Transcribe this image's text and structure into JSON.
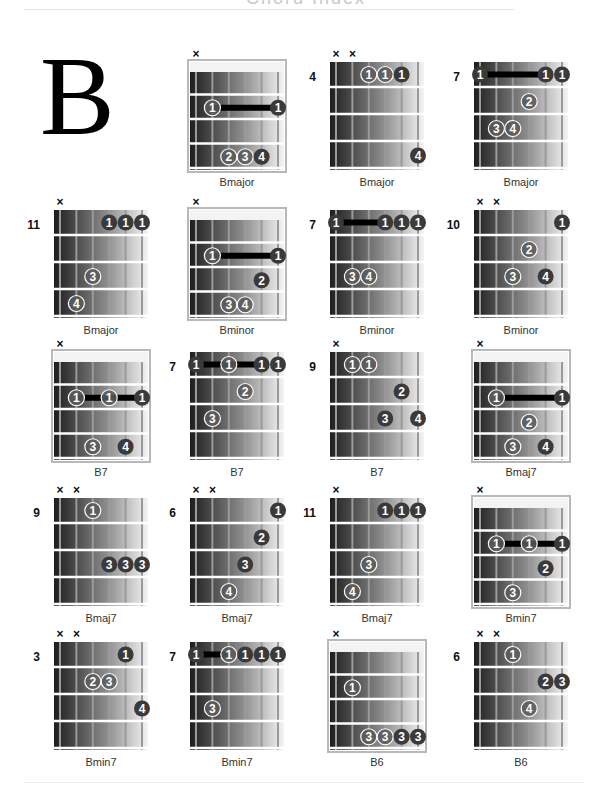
{
  "page": {
    "header_title": "Chord Index",
    "key_letter": "B"
  },
  "colors": {
    "finger_dark": "#3a3a3a",
    "finger_ring": "#ffffff",
    "barre": "#000000",
    "fret_line": "#ffffff",
    "string_line": "#9a9a9a",
    "nut": "#f3f3f3",
    "frame": "#b8b8b8"
  },
  "chords": [
    {
      "name": "Bmajor",
      "start_fret": null,
      "muted": [
        1
      ],
      "barres": [
        {
          "fret": 2,
          "from": 2,
          "to": 6
        }
      ],
      "fingers": [
        {
          "string": 2,
          "fret": 2,
          "finger": "1",
          "style": "light"
        },
        {
          "string": 6,
          "fret": 2,
          "finger": "1",
          "style": "dark"
        },
        {
          "string": 3,
          "fret": 4,
          "finger": "2",
          "style": "light"
        },
        {
          "string": 4,
          "fret": 4,
          "finger": "3",
          "style": "light"
        },
        {
          "string": 5,
          "fret": 4,
          "finger": "4",
          "style": "dark"
        }
      ]
    },
    {
      "name": "Bmajor",
      "start_fret": "4",
      "muted": [
        1,
        2
      ],
      "barres": [],
      "fingers": [
        {
          "string": 3,
          "fret": 1,
          "finger": "1",
          "style": "light"
        },
        {
          "string": 4,
          "fret": 1,
          "finger": "1",
          "style": "light"
        },
        {
          "string": 5,
          "fret": 1,
          "finger": "1",
          "style": "dark"
        },
        {
          "string": 6,
          "fret": 4,
          "finger": "4",
          "style": "dark"
        }
      ]
    },
    {
      "name": "Bmajor",
      "start_fret": "7",
      "muted": [],
      "barres": [
        {
          "fret": 1,
          "from": 1,
          "to": 5
        }
      ],
      "fingers": [
        {
          "string": 1,
          "fret": 1,
          "finger": "1",
          "style": "dark"
        },
        {
          "string": 5,
          "fret": 1,
          "finger": "1",
          "style": "dark"
        },
        {
          "string": 6,
          "fret": 1,
          "finger": "1",
          "style": "dark"
        },
        {
          "string": 4,
          "fret": 2,
          "finger": "2",
          "style": "light"
        },
        {
          "string": 2,
          "fret": 3,
          "finger": "3",
          "style": "light"
        },
        {
          "string": 3,
          "fret": 3,
          "finger": "4",
          "style": "light"
        }
      ]
    },
    {
      "name": "Bmajor",
      "start_fret": "11",
      "muted": [
        1
      ],
      "barres": [],
      "fingers": [
        {
          "string": 4,
          "fret": 1,
          "finger": "1",
          "style": "dark"
        },
        {
          "string": 5,
          "fret": 1,
          "finger": "1",
          "style": "dark"
        },
        {
          "string": 6,
          "fret": 1,
          "finger": "1",
          "style": "dark"
        },
        {
          "string": 3,
          "fret": 3,
          "finger": "3",
          "style": "light"
        },
        {
          "string": 2,
          "fret": 4,
          "finger": "4",
          "style": "light"
        }
      ]
    },
    {
      "name": "Bminor",
      "start_fret": null,
      "muted": [
        1
      ],
      "barres": [
        {
          "fret": 2,
          "from": 2,
          "to": 6
        }
      ],
      "fingers": [
        {
          "string": 2,
          "fret": 2,
          "finger": "1",
          "style": "light"
        },
        {
          "string": 6,
          "fret": 2,
          "finger": "1",
          "style": "dark"
        },
        {
          "string": 5,
          "fret": 3,
          "finger": "2",
          "style": "dark"
        },
        {
          "string": 3,
          "fret": 4,
          "finger": "3",
          "style": "light"
        },
        {
          "string": 4,
          "fret": 4,
          "finger": "4",
          "style": "light"
        }
      ]
    },
    {
      "name": "Bminor",
      "start_fret": "7",
      "muted": [],
      "barres": [
        {
          "fret": 1,
          "from": 1,
          "to": 4
        }
      ],
      "fingers": [
        {
          "string": 1,
          "fret": 1,
          "finger": "1",
          "style": "dark"
        },
        {
          "string": 4,
          "fret": 1,
          "finger": "1",
          "style": "dark"
        },
        {
          "string": 5,
          "fret": 1,
          "finger": "1",
          "style": "dark"
        },
        {
          "string": 6,
          "fret": 1,
          "finger": "1",
          "style": "dark"
        },
        {
          "string": 2,
          "fret": 3,
          "finger": "3",
          "style": "light"
        },
        {
          "string": 3,
          "fret": 3,
          "finger": "4",
          "style": "light"
        }
      ]
    },
    {
      "name": "Bminor",
      "start_fret": "10",
      "muted": [
        1,
        2
      ],
      "barres": [],
      "fingers": [
        {
          "string": 6,
          "fret": 1,
          "finger": "1",
          "style": "dark"
        },
        {
          "string": 4,
          "fret": 2,
          "finger": "2",
          "style": "light"
        },
        {
          "string": 3,
          "fret": 3,
          "finger": "3",
          "style": "light"
        },
        {
          "string": 5,
          "fret": 3,
          "finger": "4",
          "style": "dark"
        }
      ]
    },
    {
      "name": "B7",
      "start_fret": null,
      "muted": [
        1
      ],
      "barres": [
        {
          "fret": 2,
          "from": 2,
          "to": 6
        }
      ],
      "fingers": [
        {
          "string": 2,
          "fret": 2,
          "finger": "1",
          "style": "light"
        },
        {
          "string": 4,
          "fret": 2,
          "finger": "1",
          "style": "light"
        },
        {
          "string": 6,
          "fret": 2,
          "finger": "1",
          "style": "dark"
        },
        {
          "string": 3,
          "fret": 4,
          "finger": "3",
          "style": "light"
        },
        {
          "string": 5,
          "fret": 4,
          "finger": "4",
          "style": "dark"
        }
      ]
    },
    {
      "name": "B7",
      "start_fret": "7",
      "muted": [],
      "barres": [
        {
          "fret": 1,
          "from": 1,
          "to": 5
        }
      ],
      "fingers": [
        {
          "string": 1,
          "fret": 1,
          "finger": "1",
          "style": "dark"
        },
        {
          "string": 3,
          "fret": 1,
          "finger": "1",
          "style": "light"
        },
        {
          "string": 5,
          "fret": 1,
          "finger": "1",
          "style": "dark"
        },
        {
          "string": 6,
          "fret": 1,
          "finger": "1",
          "style": "dark"
        },
        {
          "string": 4,
          "fret": 2,
          "finger": "2",
          "style": "light"
        },
        {
          "string": 2,
          "fret": 3,
          "finger": "3",
          "style": "light"
        }
      ]
    },
    {
      "name": "B7",
      "start_fret": "9",
      "muted": [
        1
      ],
      "barres": [],
      "fingers": [
        {
          "string": 2,
          "fret": 1,
          "finger": "1",
          "style": "light"
        },
        {
          "string": 3,
          "fret": 1,
          "finger": "1",
          "style": "light"
        },
        {
          "string": 5,
          "fret": 2,
          "finger": "2",
          "style": "dark"
        },
        {
          "string": 4,
          "fret": 3,
          "finger": "3",
          "style": "dark"
        },
        {
          "string": 6,
          "fret": 3,
          "finger": "4",
          "style": "dark"
        }
      ]
    },
    {
      "name": "Bmaj7",
      "start_fret": null,
      "muted": [
        1
      ],
      "barres": [
        {
          "fret": 2,
          "from": 2,
          "to": 6
        }
      ],
      "fingers": [
        {
          "string": 2,
          "fret": 2,
          "finger": "1",
          "style": "light"
        },
        {
          "string": 6,
          "fret": 2,
          "finger": "1",
          "style": "dark"
        },
        {
          "string": 4,
          "fret": 3,
          "finger": "2",
          "style": "light"
        },
        {
          "string": 3,
          "fret": 4,
          "finger": "3",
          "style": "light"
        },
        {
          "string": 5,
          "fret": 4,
          "finger": "4",
          "style": "dark"
        }
      ]
    },
    {
      "name": "Bmaj7",
      "start_fret": "9",
      "muted": [
        1,
        2
      ],
      "barres": [],
      "fingers": [
        {
          "string": 3,
          "fret": 1,
          "finger": "1",
          "style": "light"
        },
        {
          "string": 4,
          "fret": 3,
          "finger": "3",
          "style": "dark"
        },
        {
          "string": 5,
          "fret": 3,
          "finger": "3",
          "style": "dark"
        },
        {
          "string": 6,
          "fret": 3,
          "finger": "3",
          "style": "dark"
        }
      ]
    },
    {
      "name": "Bmaj7",
      "start_fret": "6",
      "muted": [
        1,
        2
      ],
      "barres": [],
      "fingers": [
        {
          "string": 6,
          "fret": 1,
          "finger": "1",
          "style": "dark"
        },
        {
          "string": 5,
          "fret": 2,
          "finger": "2",
          "style": "dark"
        },
        {
          "string": 4,
          "fret": 3,
          "finger": "3",
          "style": "dark"
        },
        {
          "string": 3,
          "fret": 4,
          "finger": "4",
          "style": "light"
        }
      ]
    },
    {
      "name": "Bmaj7",
      "start_fret": "11",
      "muted": [
        1
      ],
      "barres": [],
      "fingers": [
        {
          "string": 4,
          "fret": 1,
          "finger": "1",
          "style": "dark"
        },
        {
          "string": 5,
          "fret": 1,
          "finger": "1",
          "style": "dark"
        },
        {
          "string": 6,
          "fret": 1,
          "finger": "1",
          "style": "dark"
        },
        {
          "string": 3,
          "fret": 3,
          "finger": "3",
          "style": "light"
        },
        {
          "string": 2,
          "fret": 4,
          "finger": "4",
          "style": "light"
        }
      ]
    },
    {
      "name": "Bmin7",
      "start_fret": null,
      "muted": [
        1
      ],
      "barres": [
        {
          "fret": 2,
          "from": 2,
          "to": 6
        }
      ],
      "fingers": [
        {
          "string": 2,
          "fret": 2,
          "finger": "1",
          "style": "light"
        },
        {
          "string": 4,
          "fret": 2,
          "finger": "1",
          "style": "light"
        },
        {
          "string": 6,
          "fret": 2,
          "finger": "1",
          "style": "dark"
        },
        {
          "string": 5,
          "fret": 3,
          "finger": "2",
          "style": "dark"
        },
        {
          "string": 3,
          "fret": 4,
          "finger": "3",
          "style": "light"
        }
      ]
    },
    {
      "name": "Bmin7",
      "start_fret": "3",
      "muted": [
        1,
        2
      ],
      "barres": [],
      "fingers": [
        {
          "string": 5,
          "fret": 1,
          "finger": "1",
          "style": "dark"
        },
        {
          "string": 3,
          "fret": 2,
          "finger": "2",
          "style": "light"
        },
        {
          "string": 4,
          "fret": 2,
          "finger": "3",
          "style": "light"
        },
        {
          "string": 6,
          "fret": 3,
          "finger": "4",
          "style": "dark"
        }
      ]
    },
    {
      "name": "Bmin7",
      "start_fret": "7",
      "muted": [],
      "barres": [
        {
          "fret": 1,
          "from": 1,
          "to": 3
        }
      ],
      "fingers": [
        {
          "string": 1,
          "fret": 1,
          "finger": "1",
          "style": "dark"
        },
        {
          "string": 3,
          "fret": 1,
          "finger": "1",
          "style": "light"
        },
        {
          "string": 4,
          "fret": 1,
          "finger": "1",
          "style": "dark"
        },
        {
          "string": 5,
          "fret": 1,
          "finger": "1",
          "style": "dark"
        },
        {
          "string": 6,
          "fret": 1,
          "finger": "1",
          "style": "dark"
        },
        {
          "string": 2,
          "fret": 3,
          "finger": "3",
          "style": "light"
        }
      ]
    },
    {
      "name": "B6",
      "start_fret": null,
      "muted": [
        1
      ],
      "barres": [],
      "fingers": [
        {
          "string": 2,
          "fret": 2,
          "finger": "1",
          "style": "light"
        },
        {
          "string": 3,
          "fret": 4,
          "finger": "3",
          "style": "light"
        },
        {
          "string": 4,
          "fret": 4,
          "finger": "3",
          "style": "light"
        },
        {
          "string": 5,
          "fret": 4,
          "finger": "3",
          "style": "dark"
        },
        {
          "string": 6,
          "fret": 4,
          "finger": "3",
          "style": "dark"
        }
      ]
    },
    {
      "name": "B6",
      "start_fret": "6",
      "muted": [
        1,
        2
      ],
      "barres": [],
      "fingers": [
        {
          "string": 3,
          "fret": 1,
          "finger": "1",
          "style": "light"
        },
        {
          "string": 5,
          "fret": 2,
          "finger": "2",
          "style": "dark"
        },
        {
          "string": 6,
          "fret": 2,
          "finger": "3",
          "style": "dark"
        },
        {
          "string": 4,
          "fret": 3,
          "finger": "4",
          "style": "light"
        }
      ]
    }
  ]
}
